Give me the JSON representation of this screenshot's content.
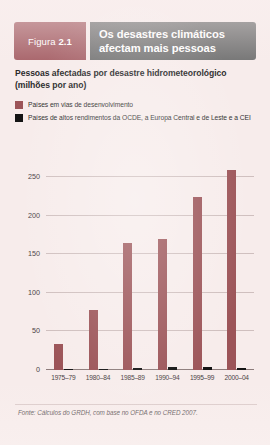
{
  "figure": {
    "badge_prefix": "Figura ",
    "badge_number": "2.1",
    "title_line_1": "Os desastres climáticos",
    "title_line_2": "afectam mais pessoas",
    "subtitle_line_1": "Pessoas afectadas por desastre hidrometeorológico",
    "subtitle_line_2": "(milhões por ano)",
    "source": "Fonte: Cálculos do GRDH, com base no OFDA e no CRED 2007.",
    "badge_color": "#a9666c",
    "title_bg_color": "#767676",
    "card_bg_color": "#f7eceb"
  },
  "legend": {
    "items": [
      {
        "label": "Países em vias de desenvolvimento",
        "color": "#9c5458",
        "swatch": "developing"
      },
      {
        "label": "Países de altos rendimentos da OCDE, a Europa Central e de Leste e a CEI",
        "color": "#141414",
        "swatch": "highincome"
      }
    ]
  },
  "chart_data": {
    "type": "bar",
    "title": "Os desastres climáticos afectam mais pessoas",
    "subtitle": "Pessoas afectadas por desastre hidrometeorológico (milhões por ano)",
    "xlabel": "",
    "ylabel": "",
    "ylim": [
      0,
      275
    ],
    "yticks": [
      0,
      50,
      100,
      150,
      200,
      250
    ],
    "ytick_labels": [
      "0",
      "50",
      "100",
      "150",
      "200",
      "250"
    ],
    "grid": true,
    "legend_position": "above-plot",
    "categories": [
      "1975–79",
      "1980–84",
      "1985–89",
      "1990–94",
      "1995–99",
      "2000–04"
    ],
    "series": [
      {
        "name": "Países em vias de desenvolvimento",
        "color": "#9c5458",
        "values": [
          34,
          78,
          165,
          170,
          225,
          259
        ]
      },
      {
        "name": "Países de altos rendimentos da OCDE, a Europa Central e de Leste e a CEI",
        "color": "#141414",
        "values": [
          1,
          1,
          2,
          4,
          4,
          3
        ]
      }
    ],
    "source": "Fonte: Cálculos do GRDH, com base no OFDA e no CRED 2007."
  }
}
